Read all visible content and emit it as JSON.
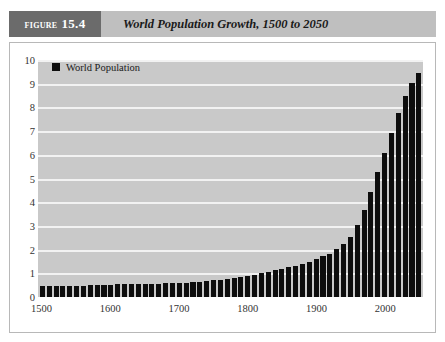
{
  "figure": {
    "label_word": "Figure",
    "label_number": "15.4",
    "title": "World Population Growth, 1500 to 2050"
  },
  "colors": {
    "banner_bg": "#bfbfbf",
    "banner_tab_bg": "#6b6b6b",
    "plot_bg": "#c9c9c9",
    "gridline": "#f2f2f2",
    "bar": "#0d0d0d",
    "frame_border": "#b8b8b8"
  },
  "chart_data": {
    "type": "bar",
    "title": "World Population Growth, 1500 to 2050",
    "xlabel": "",
    "ylabel": "",
    "ylim": [
      0,
      10
    ],
    "xlim": [
      1500,
      2050
    ],
    "ytick_labels": [
      "0",
      "1",
      "2",
      "3",
      "4",
      "5",
      "6",
      "7",
      "8",
      "9",
      "10"
    ],
    "yticks": [
      0,
      1,
      2,
      3,
      4,
      5,
      6,
      7,
      8,
      9,
      10
    ],
    "xtick_labels": [
      "1500",
      "1600",
      "1700",
      "1800",
      "1900",
      "2000"
    ],
    "xticks": [
      1500,
      1600,
      1700,
      1800,
      1900,
      2000
    ],
    "grid": true,
    "legend": [
      "World Population"
    ],
    "legend_position": "top-left",
    "series": [
      {
        "name": "World Population",
        "unit": "billions",
        "categories": [
          1500,
          1510,
          1520,
          1530,
          1540,
          1550,
          1560,
          1570,
          1580,
          1590,
          1600,
          1610,
          1620,
          1630,
          1640,
          1650,
          1660,
          1670,
          1680,
          1690,
          1700,
          1710,
          1720,
          1730,
          1740,
          1750,
          1760,
          1770,
          1780,
          1790,
          1800,
          1810,
          1820,
          1830,
          1840,
          1850,
          1860,
          1870,
          1880,
          1890,
          1900,
          1910,
          1920,
          1930,
          1940,
          1950,
          1960,
          1970,
          1980,
          1990,
          2000,
          2010,
          2020,
          2030,
          2040,
          2050
        ],
        "values": [
          0.45,
          0.45,
          0.46,
          0.46,
          0.47,
          0.48,
          0.48,
          0.49,
          0.5,
          0.51,
          0.52,
          0.53,
          0.53,
          0.54,
          0.54,
          0.55,
          0.56,
          0.57,
          0.58,
          0.59,
          0.6,
          0.61,
          0.63,
          0.65,
          0.67,
          0.7,
          0.73,
          0.76,
          0.8,
          0.85,
          0.9,
          0.95,
          1.0,
          1.06,
          1.13,
          1.2,
          1.26,
          1.32,
          1.4,
          1.49,
          1.6,
          1.72,
          1.83,
          2.02,
          2.25,
          2.52,
          3.02,
          3.68,
          4.43,
          5.28,
          6.07,
          6.9,
          7.75,
          8.5,
          9.05,
          9.45
        ]
      }
    ]
  }
}
